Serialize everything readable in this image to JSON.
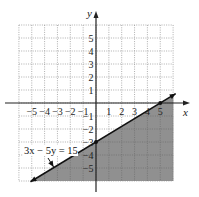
{
  "chart_data": {
    "type": "line",
    "title": "",
    "xlabel": "x",
    "ylabel": "y",
    "xlim": [
      -6,
      6
    ],
    "ylim": [
      -6,
      6
    ],
    "grid": true,
    "grid_style": "dotted",
    "x_ticks": [
      -5,
      -4,
      -3,
      -2,
      -1,
      1,
      2,
      3,
      4,
      5
    ],
    "y_ticks": [
      5,
      4,
      3,
      2,
      1,
      -1,
      -2,
      -3,
      -4,
      -5
    ],
    "x_tick_labels": [
      "−5",
      "−4",
      "−3",
      "−2",
      "−1",
      "1",
      "2",
      "3",
      "4",
      "5"
    ],
    "y_tick_labels": [
      "5",
      "4",
      "3",
      "2",
      "1",
      "−1",
      "−2",
      "−3",
      "−4",
      "−5"
    ],
    "series": [
      {
        "name": "3x − 5y = 15",
        "kind": "boundary-line",
        "style": "solid",
        "x": [
          -5.0,
          6.0
        ],
        "y": [
          -6.0,
          0.6
        ],
        "points_marked": [
          {
            "x": 0,
            "y": -3
          },
          {
            "x": 5,
            "y": 0
          }
        ]
      }
    ],
    "shaded_region": {
      "inequality": "3x − 5y ≥ 15",
      "side": "below-right of line",
      "color": "#8a8a8a"
    },
    "annotations": [
      {
        "text": "3x − 5y = 15",
        "points_to": {
          "x": -3.3,
          "y": -5
        }
      }
    ]
  },
  "labels": {
    "x_axis": "x",
    "y_axis": "y",
    "equation": "3x − 5y = 15"
  }
}
